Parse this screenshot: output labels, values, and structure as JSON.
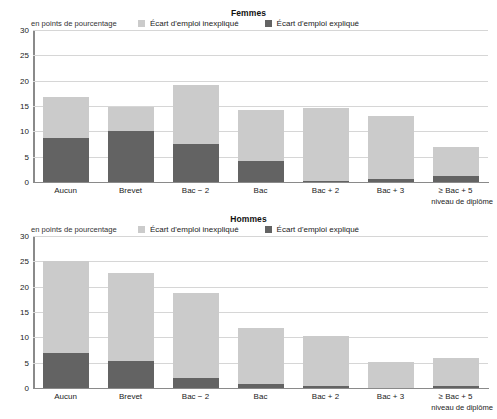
{
  "clipped_header": "",
  "colors": {
    "unexplained": "#cbcbcb",
    "explained": "#636363",
    "axis": "#8a8a8a",
    "grid": "#d6d6d6"
  },
  "legend": {
    "unexplained_label": "Écart d'emploi inexpliqué",
    "explained_label": "Écart d'emploi expliqué"
  },
  "axis_caption": "niveau de diplôme",
  "unit_label": "en points de pourcentage",
  "yticks": [
    "0",
    "5",
    "10",
    "15",
    "20",
    "25",
    "30"
  ],
  "chart_data": [
    {
      "type": "bar",
      "title": "Femmes",
      "subtitle": "en points de pourcentage",
      "xlabel": "niveau de diplôme",
      "ylabel": "en points de pourcentage",
      "ylim": [
        0,
        30
      ],
      "yticks": [
        0,
        5,
        10,
        15,
        20,
        25,
        30
      ],
      "grid": true,
      "stacked": true,
      "legend_position": "top-center",
      "categories": [
        "Aucun",
        "Brevet",
        "Bac − 2",
        "Bac",
        "Bac + 2",
        "Bac + 3",
        "≥ Bac + 5"
      ],
      "series": [
        {
          "name": "Écart d'emploi expliqué",
          "values": [
            8.6,
            10.0,
            7.6,
            4.2,
            0.2,
            0.6,
            1.2
          ]
        },
        {
          "name": "Écart d'emploi inexpliqué",
          "values": [
            8.1,
            4.8,
            11.5,
            10.0,
            14.5,
            12.4,
            5.8
          ]
        }
      ],
      "totals": [
        16.7,
        14.8,
        19.1,
        14.2,
        14.7,
        13.0,
        7.0
      ]
    },
    {
      "type": "bar",
      "title": "Hommes",
      "subtitle": "en points de pourcentage",
      "xlabel": "niveau de diplôme",
      "ylabel": "en points de pourcentage",
      "ylim": [
        0,
        30
      ],
      "yticks": [
        0,
        5,
        10,
        15,
        20,
        25,
        30
      ],
      "grid": true,
      "stacked": true,
      "legend_position": "top-center",
      "categories": [
        "Aucun",
        "Brevet",
        "Bac − 2",
        "Bac",
        "Bac + 2",
        "Bac + 3",
        "≥ Bac + 5"
      ],
      "series": [
        {
          "name": "Écart d'emploi expliqué",
          "values": [
            7.0,
            5.4,
            1.9,
            0.7,
            0.35,
            0.0,
            0.3
          ]
        },
        {
          "name": "Écart d'emploi inexpliqué",
          "values": [
            18.0,
            17.3,
            16.8,
            11.2,
            9.85,
            5.2,
            5.6
          ]
        }
      ],
      "totals": [
        25.0,
        22.7,
        18.7,
        11.9,
        10.2,
        5.2,
        5.9
      ]
    }
  ]
}
